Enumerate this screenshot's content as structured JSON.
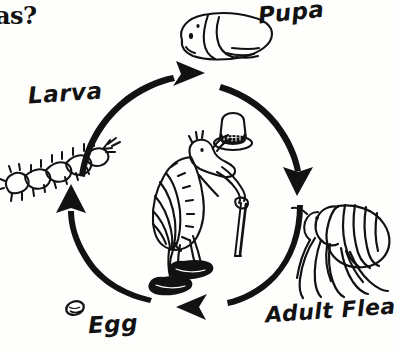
{
  "page": {
    "kind": "flea-life-cycle-diagram",
    "background_color": "#fefefd",
    "ink_color": "#121212",
    "width": 393,
    "height": 354
  },
  "title_fragment": {
    "text": "as?",
    "note_visible": "bold serif text clipped at left edge of image"
  },
  "cycle": {
    "direction": "clockwise",
    "center_figure": {
      "name": "cartoon-flea-with-top-hat",
      "accessories": [
        "top hat",
        "cane",
        "shoes"
      ]
    },
    "stages": [
      {
        "key": "egg",
        "label": "Egg",
        "position": "bottom-left",
        "illustration": "egg-oval"
      },
      {
        "key": "larva",
        "label": "Larva",
        "position": "left",
        "illustration": "segmented-bristly-larva"
      },
      {
        "key": "pupa",
        "label": "Pupa",
        "position": "top",
        "illustration": "cocoon-pupa"
      },
      {
        "key": "adult_flea",
        "label": "Adult Flea",
        "position": "bottom-right",
        "illustration": "adult-flea-side-view"
      }
    ],
    "arrows": [
      {
        "key": "egg-to-larva",
        "from": "Egg",
        "to": "Larva",
        "heading": "up",
        "position": "left"
      },
      {
        "key": "larva-to-pupa",
        "from": "Larva",
        "to": "Pupa",
        "heading": "up-right",
        "position": "top-left"
      },
      {
        "key": "pupa-to-adult",
        "from": "Pupa",
        "to": "Adult Flea",
        "heading": "down",
        "position": "right"
      },
      {
        "key": "adult-to-egg",
        "from": "Adult Flea",
        "to": "Egg",
        "heading": "left",
        "position": "bottom"
      }
    ]
  }
}
